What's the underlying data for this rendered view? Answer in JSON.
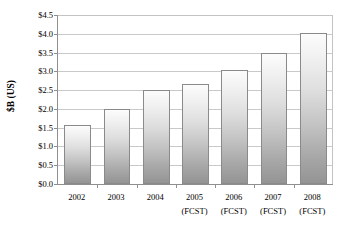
{
  "chart_data": {
    "type": "bar",
    "title": "",
    "xlabel": "",
    "ylabel": "$B (US)",
    "ylim": [
      0.0,
      4.5
    ],
    "ytick_step": 0.5,
    "grid": true,
    "legend": false,
    "categories": [
      "2002",
      "2003",
      "2004",
      "2005",
      "2006",
      "2007",
      "2008"
    ],
    "category_sublabels": [
      "",
      "",
      "",
      "(FCST)",
      "(FCST)",
      "(FCST)",
      "(FCST)"
    ],
    "values": [
      1.58,
      2.0,
      2.5,
      2.65,
      3.03,
      3.5,
      4.03
    ],
    "ytick_labels": [
      "$4.5",
      "$4.0",
      "$3.5",
      "$3.0",
      "$2.5",
      "$2.0",
      "$1.5",
      "$1.0",
      "$0.5",
      "$0.0"
    ],
    "ytick_values": [
      4.5,
      4.0,
      3.5,
      3.0,
      2.5,
      2.0,
      1.5,
      1.0,
      0.5,
      0.0
    ],
    "colors": {
      "bar_top": "#fcfcfc",
      "bar_bottom": "#949494",
      "bar_border": "#8a8a8a",
      "gridline": "#c9c9c9",
      "axis": "#8f8f8f",
      "background": "#ffffff",
      "text": "#000000"
    }
  }
}
